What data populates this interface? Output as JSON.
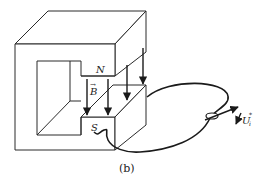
{
  "figure": {
    "caption": "(b)",
    "labels": {
      "north_pole": "N",
      "south_pole": "S",
      "field": "B",
      "field_vector_mark": "→",
      "voltage": "U",
      "voltage_sub": "i",
      "voltage_sup": "*"
    },
    "field_arrow_count": 5,
    "colors": {
      "line": "#2a2a2a",
      "background": "#ffffff"
    }
  }
}
